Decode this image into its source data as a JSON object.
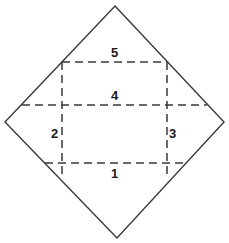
{
  "figure": {
    "canvas": {
      "width": 229,
      "height": 243
    },
    "colors": {
      "background": "#ffffff",
      "outline": "#3a3a3a",
      "dashed": "#3a3a3a",
      "label_text": "#1a1a1a"
    },
    "outer_shape": {
      "name": "diamond",
      "stroke": "solid",
      "vertices": [
        {
          "name": "top",
          "x": 115,
          "y": 6
        },
        {
          "name": "right",
          "x": 224,
          "y": 122
        },
        {
          "name": "bottom",
          "x": 117,
          "y": 238
        },
        {
          "name": "left",
          "x": 5,
          "y": 122
        }
      ]
    },
    "dashed_lines": [
      {
        "name": "fold-line-5-top-horizontal",
        "orientation": "horizontal",
        "x1": 62,
        "y1": 62,
        "x2": 167,
        "y2": 62
      },
      {
        "name": "fold-line-4-middle-horizontal",
        "orientation": "horizontal",
        "x1": 22,
        "y1": 105,
        "x2": 207,
        "y2": 105
      },
      {
        "name": "fold-line-1-bottom-horizontal",
        "orientation": "horizontal",
        "x1": 45,
        "y1": 163,
        "x2": 186,
        "y2": 163
      },
      {
        "name": "fold-line-2-left-vertical",
        "orientation": "vertical",
        "x1": 62,
        "y1": 62,
        "x2": 62,
        "y2": 174
      },
      {
        "name": "fold-line-3-right-vertical",
        "orientation": "vertical",
        "x1": 167,
        "y1": 62,
        "x2": 167,
        "y2": 174
      }
    ],
    "labels": [
      {
        "id": "label-5",
        "text": "5",
        "x": 111,
        "y": 46
      },
      {
        "id": "label-4",
        "text": "4",
        "x": 111,
        "y": 89
      },
      {
        "id": "label-2",
        "text": "2",
        "x": 51,
        "y": 127
      },
      {
        "id": "label-3",
        "text": "3",
        "x": 169,
        "y": 127
      },
      {
        "id": "label-1",
        "text": "1",
        "x": 111,
        "y": 167
      }
    ]
  }
}
